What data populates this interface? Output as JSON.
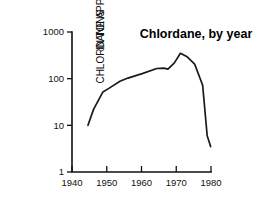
{
  "chart_data": {
    "type": "line",
    "title": "Chlordane, by year",
    "xlabel": "",
    "ylabel": "CHLORDANE APPLICATION, IN TONS",
    "ylabel_lines": [
      "CHLORDANE APPLICATION,",
      "IN TONS"
    ],
    "yscale": "log",
    "xscale": "linear",
    "xlim": [
      1940,
      1980
    ],
    "ylim": [
      1,
      1000
    ],
    "grid": false,
    "legend": false,
    "xticks": [
      1940,
      1950,
      1960,
      1970,
      1980
    ],
    "xtick_labels": [
      "1940",
      "1950",
      "1960",
      "1970",
      "1980"
    ],
    "yticks": [
      1,
      10,
      100,
      1000
    ],
    "ytick_labels": [
      "1",
      "10",
      "100",
      "1000"
    ],
    "series": [
      {
        "name": "Chlordane application",
        "x": [
          1944.6,
          1946.2,
          1948.9,
          1950.6,
          1953.8,
          1956.1,
          1960.2,
          1964.4,
          1966.4,
          1967.6,
          1969.4,
          1971.2,
          1973.0,
          1975.3,
          1977.6,
          1978.9,
          1979.9
        ],
        "values": [
          10.0,
          22.0,
          52.0,
          62.0,
          88.0,
          103.0,
          128.0,
          165.0,
          168.0,
          160.0,
          215.0,
          350.0,
          300.0,
          205.0,
          72.0,
          6.0,
          3.5
        ]
      }
    ]
  },
  "geometry": {
    "plot_left": 72,
    "plot_right": 211,
    "plot_top": 32,
    "plot_bottom": 172,
    "title_x": 196,
    "title_y": 38,
    "ylabel_x1": 17,
    "ylabel_x2": 30,
    "ylabel_y": 104
  }
}
